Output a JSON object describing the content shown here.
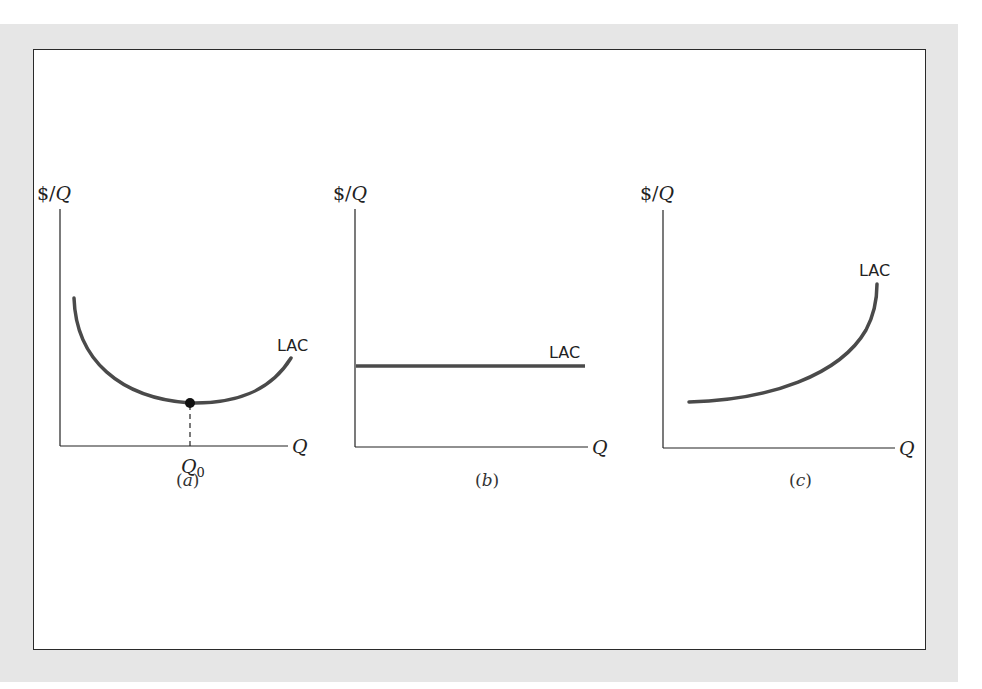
{
  "figure": {
    "background_color": "#e6e6e6",
    "frame_color": "#2a2a2a",
    "curve_color": "#4a4a4a",
    "panels": [
      {
        "id": "a",
        "caption": "(a)",
        "y_axis_label": "$/Q",
        "x_axis_label": "Q",
        "curve_label": "LAC",
        "curve_shape": "U-shaped",
        "marked_point_label": "Q0",
        "marked_point_main": "Q",
        "marked_point_sub": "0"
      },
      {
        "id": "b",
        "caption": "(b)",
        "y_axis_label": "$/Q",
        "x_axis_label": "Q",
        "curve_label": "LAC",
        "curve_shape": "horizontal"
      },
      {
        "id": "c",
        "caption": "(c)",
        "y_axis_label": "$/Q",
        "x_axis_label": "Q",
        "curve_label": "LAC",
        "curve_shape": "increasing"
      }
    ]
  }
}
